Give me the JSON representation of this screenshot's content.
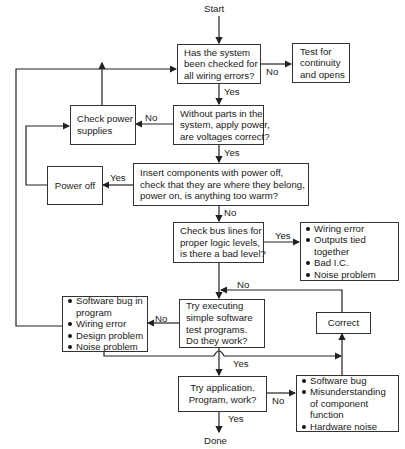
{
  "terminals": {
    "start": "Start",
    "done": "Done"
  },
  "boxes": {
    "wiring_check": [
      "Has the system",
      "been checked for",
      "all wiring errors?"
    ],
    "test_continuity": [
      "Test for",
      "continuity",
      "and opens"
    ],
    "voltages": [
      "Without parts in the",
      "system, apply power,",
      "are voltages correct?"
    ],
    "check_power": [
      "Check power",
      "supplies"
    ],
    "insert_components": [
      "Insert components with power off,",
      "check that they are where they belong,",
      "power on, is anything too warm?"
    ],
    "power_off": [
      "Power off"
    ],
    "bus_lines": [
      "Check bus lines for",
      "proper logic levels,",
      "is there a bad level?"
    ],
    "try_executing": [
      "Try executing",
      "simple software",
      "test programs.",
      "Do they work?"
    ],
    "correct": [
      "Correct"
    ],
    "try_application": [
      "Try application.",
      "Program, work?"
    ]
  },
  "lists": {
    "bad_level_causes": [
      [
        "Wiring error"
      ],
      [
        "Outputs tied",
        "together"
      ],
      [
        "Bad I.C."
      ],
      [
        "Noise problem"
      ]
    ],
    "test_fail_causes": [
      [
        "Software bug in",
        "program"
      ],
      [
        "Wiring error"
      ],
      [
        "Design problem"
      ],
      [
        "Noise problem"
      ]
    ],
    "app_fail_causes": [
      [
        "Software bug"
      ],
      [
        "Misunderstanding",
        "of component",
        "function"
      ],
      [
        "Hardware noise"
      ]
    ]
  },
  "labels": {
    "wiring_no": "No",
    "wiring_yes": "Yes",
    "voltages_no": "No",
    "voltages_yes": "Yes",
    "insert_yes": "Yes",
    "insert_no": "No",
    "bus_yes": "Yes",
    "bus_no": "No",
    "exec_no": "No",
    "exec_yes": "Yes",
    "app_no": "No",
    "app_yes": "Yes"
  },
  "colors": {
    "line": "#222222",
    "text": "#1a1a1a",
    "background": "#ffffff"
  }
}
